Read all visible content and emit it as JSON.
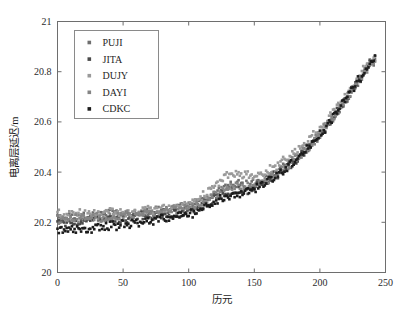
{
  "chart_data": {
    "type": "scatter",
    "title": "",
    "xlabel": "历元",
    "ylabel": "电离层延迟/m",
    "xlim": [
      0,
      250
    ],
    "ylim": [
      20,
      21
    ],
    "xticks": [
      0,
      50,
      100,
      150,
      200,
      250
    ],
    "yticks": [
      20,
      20.2,
      20.4,
      20.6,
      20.8,
      21
    ],
    "xtick_labels": [
      "0",
      "50",
      "100",
      "150",
      "200",
      "250"
    ],
    "ytick_labels": [
      "20",
      "20.2",
      "20.4",
      "20.6",
      "20.8",
      "21"
    ],
    "grid": false,
    "legend_position": "upper left",
    "marker": "square",
    "marker_size": 2.6,
    "series": [
      {
        "name": "PUJI",
        "color": "#6f6f6f",
        "x": [
          0,
          5,
          10,
          15,
          20,
          25,
          30,
          35,
          40,
          45,
          50,
          55,
          60,
          65,
          70,
          75,
          80,
          85,
          90,
          95,
          100,
          105,
          110,
          115,
          120,
          125,
          130,
          135,
          140,
          145,
          150,
          155,
          160,
          165,
          170,
          175,
          180,
          185,
          190,
          195,
          200,
          205,
          210,
          215,
          220,
          225,
          230,
          235,
          240
        ],
        "values": [
          20.22,
          20.215,
          20.222,
          20.218,
          20.228,
          20.224,
          20.232,
          20.227,
          20.235,
          20.23,
          20.238,
          20.234,
          20.242,
          20.238,
          20.246,
          20.244,
          20.252,
          20.248,
          20.258,
          20.256,
          20.264,
          20.27,
          20.282,
          20.296,
          20.312,
          20.33,
          20.346,
          20.352,
          20.35,
          20.348,
          20.352,
          20.362,
          20.376,
          20.392,
          20.41,
          20.428,
          20.448,
          20.47,
          20.494,
          20.52,
          20.548,
          20.58,
          20.614,
          20.65,
          20.686,
          20.724,
          20.764,
          20.804,
          20.84
        ]
      },
      {
        "name": "JITA",
        "color": "#4a4a4a",
        "x": [
          0,
          5,
          10,
          15,
          20,
          25,
          30,
          35,
          40,
          45,
          50,
          55,
          60,
          65,
          70,
          75,
          80,
          85,
          90,
          95,
          100,
          105,
          110,
          115,
          120,
          125,
          130,
          135,
          140,
          145,
          150,
          155,
          160,
          165,
          170,
          175,
          180,
          185,
          190,
          195,
          200,
          205,
          210,
          215,
          220,
          225,
          230,
          235,
          240
        ],
        "values": [
          20.2,
          20.196,
          20.204,
          20.199,
          20.208,
          20.203,
          20.212,
          20.207,
          20.216,
          20.211,
          20.22,
          20.216,
          20.224,
          20.221,
          20.229,
          20.226,
          20.234,
          20.232,
          20.24,
          20.239,
          20.248,
          20.256,
          20.268,
          20.282,
          20.298,
          20.312,
          20.322,
          20.326,
          20.328,
          20.332,
          20.34,
          20.352,
          20.366,
          20.382,
          20.4,
          20.42,
          20.442,
          20.466,
          20.492,
          20.52,
          20.55,
          20.582,
          20.616,
          20.652,
          20.69,
          20.728,
          20.768,
          20.808,
          20.845
        ]
      },
      {
        "name": "DUJY",
        "color": "#9a9a9a",
        "x": [
          0,
          5,
          10,
          15,
          20,
          25,
          30,
          35,
          40,
          45,
          50,
          55,
          60,
          65,
          70,
          75,
          80,
          85,
          90,
          95,
          100,
          105,
          110,
          115,
          120,
          125,
          130,
          135,
          140,
          145,
          150,
          155,
          160,
          165,
          170,
          175,
          180,
          185,
          190,
          195,
          200,
          205,
          210,
          215,
          220,
          225,
          230,
          235,
          240
        ],
        "values": [
          20.232,
          20.226,
          20.234,
          20.228,
          20.238,
          20.232,
          20.24,
          20.234,
          20.242,
          20.236,
          20.244,
          20.24,
          20.248,
          20.244,
          20.252,
          20.25,
          20.258,
          20.256,
          20.266,
          20.268,
          20.278,
          20.29,
          20.306,
          20.324,
          20.346,
          20.368,
          20.386,
          20.392,
          20.388,
          20.382,
          20.384,
          20.392,
          20.404,
          20.42,
          20.438,
          20.456,
          20.476,
          20.498,
          20.522,
          20.548,
          20.576,
          20.606,
          20.638,
          20.672,
          20.708,
          20.744,
          20.782,
          20.818,
          20.85
        ]
      },
      {
        "name": "DAYI",
        "color": "#858585",
        "x": [
          0,
          5,
          10,
          15,
          20,
          25,
          30,
          35,
          40,
          45,
          50,
          55,
          60,
          65,
          70,
          75,
          80,
          85,
          90,
          95,
          100,
          105,
          110,
          115,
          120,
          125,
          130,
          135,
          140,
          145,
          150,
          155,
          160,
          165,
          170,
          175,
          180,
          185,
          190,
          195,
          200,
          205,
          210,
          215,
          220,
          225,
          230,
          235,
          240
        ],
        "values": [
          20.212,
          20.206,
          20.214,
          20.209,
          20.218,
          20.213,
          20.222,
          20.217,
          20.226,
          20.222,
          20.23,
          20.226,
          20.234,
          20.231,
          20.239,
          20.237,
          20.245,
          20.243,
          20.252,
          20.252,
          20.26,
          20.268,
          20.28,
          20.294,
          20.31,
          20.326,
          20.338,
          20.344,
          20.342,
          20.34,
          20.344,
          20.354,
          20.368,
          20.384,
          20.402,
          20.422,
          20.444,
          20.468,
          20.494,
          20.522,
          20.552,
          20.584,
          20.618,
          20.654,
          20.69,
          20.728,
          20.768,
          20.806,
          20.842
        ]
      },
      {
        "name": "CDKC",
        "color": "#1c1c1c",
        "x": [
          0,
          5,
          10,
          15,
          20,
          25,
          30,
          35,
          40,
          45,
          50,
          55,
          60,
          65,
          70,
          75,
          80,
          85,
          90,
          95,
          100,
          105,
          110,
          115,
          120,
          125,
          130,
          135,
          140,
          145,
          150,
          155,
          160,
          165,
          170,
          175,
          180,
          185,
          190,
          195,
          200,
          205,
          210,
          215,
          220,
          225,
          230,
          235,
          240
        ],
        "values": [
          20.166,
          20.162,
          20.172,
          20.168,
          20.178,
          20.174,
          20.184,
          20.18,
          20.19,
          20.186,
          20.196,
          20.193,
          20.202,
          20.199,
          20.208,
          20.206,
          20.215,
          20.214,
          20.223,
          20.224,
          20.234,
          20.244,
          20.256,
          20.27,
          20.284,
          20.296,
          20.306,
          20.312,
          20.316,
          20.322,
          20.332,
          20.346,
          20.362,
          20.38,
          20.4,
          20.422,
          20.444,
          20.468,
          20.494,
          20.522,
          20.552,
          20.584,
          20.618,
          20.654,
          20.692,
          20.73,
          20.77,
          20.81,
          20.848
        ]
      }
    ],
    "noise_amplitude": 0.016
  },
  "legend": {
    "items": [
      {
        "label": "PUJI",
        "color": "#6f6f6f"
      },
      {
        "label": "JITA",
        "color": "#4a4a4a"
      },
      {
        "label": "DUJY",
        "color": "#9a9a9a"
      },
      {
        "label": "DAYI",
        "color": "#858585"
      },
      {
        "label": "CDKC",
        "color": "#1c1c1c"
      }
    ]
  },
  "colors": {
    "background": "#ffffff",
    "axis": "#6e6e6e",
    "text": "#1a1a1a",
    "legend_border": "#8a8a8a"
  }
}
